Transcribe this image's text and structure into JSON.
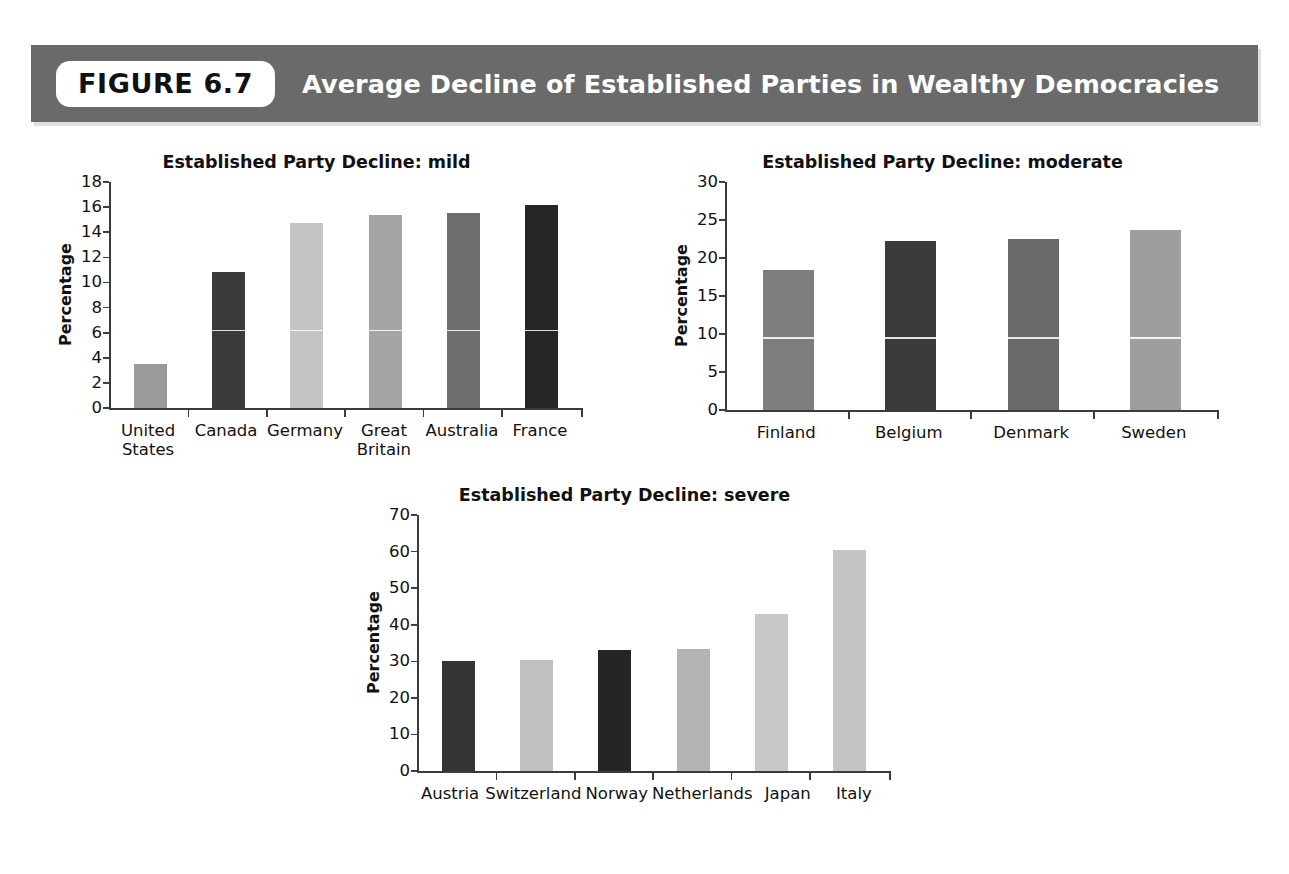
{
  "header": {
    "badge_label": "FIGURE 6.7",
    "title": "Average Decline of Established Parties in Wealthy Democracies",
    "bar_color": "#6a6a6a",
    "badge_bg": "#ffffff",
    "title_color": "#ffffff"
  },
  "footer": {
    "note": ""
  },
  "chart_data": [
    {
      "id": "mild",
      "type": "bar",
      "title": "Established Party Decline: mild",
      "xlabel": "",
      "ylabel": "Percentage",
      "ylim": [
        0,
        18
      ],
      "ytick_step": 2,
      "yticks": [
        0,
        2,
        4,
        6,
        8,
        10,
        12,
        14,
        16,
        18
      ],
      "grid": false,
      "legend": "none",
      "categories": [
        "United States",
        "Canada",
        "Germany",
        "Great Britain",
        "Australia",
        "France"
      ],
      "values": [
        3.5,
        10.8,
        14.7,
        15.4,
        15.5,
        16.2
      ],
      "bar_colors": [
        "#9a9a9a",
        "#3a3a3a",
        "#c4c4c4",
        "#a5a5a5",
        "#6e6e6e",
        "#262626"
      ]
    },
    {
      "id": "moderate",
      "type": "bar",
      "title": "Established Party Decline: moderate",
      "xlabel": "",
      "ylabel": "Percentage",
      "ylim": [
        0,
        30
      ],
      "ytick_step": 5,
      "yticks": [
        0,
        5,
        10,
        15,
        20,
        25,
        30
      ],
      "grid": false,
      "legend": "none",
      "categories": [
        "Finland",
        "Belgium",
        "Denmark",
        "Sweden"
      ],
      "values": [
        18.4,
        22.3,
        22.5,
        23.7
      ],
      "bar_colors": [
        "#7e7e7e",
        "#3a3a3a",
        "#6a6a6a",
        "#9e9e9e"
      ]
    },
    {
      "id": "severe",
      "type": "bar",
      "title": "Established Party Decline: severe",
      "xlabel": "",
      "ylabel": "Percentage",
      "ylim": [
        0,
        70
      ],
      "ytick_step": 10,
      "yticks": [
        0,
        10,
        20,
        30,
        40,
        50,
        60,
        70
      ],
      "grid": false,
      "legend": "none",
      "categories": [
        "Austria",
        "Switzerland",
        "Norway",
        "Netherlands",
        "Japan",
        "Italy"
      ],
      "values": [
        30.0,
        30.4,
        33.0,
        33.5,
        43.0,
        60.3
      ],
      "bar_colors": [
        "#343434",
        "#c0c0c0",
        "#252525",
        "#b4b4b4",
        "#c8c8c8",
        "#c4c4c4"
      ]
    }
  ]
}
